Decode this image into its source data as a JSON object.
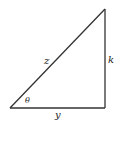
{
  "diagram": {
    "type": "right-triangle",
    "stroke_color": "#333333",
    "vertices": {
      "bottom_left": [
        10,
        108
      ],
      "bottom_right": [
        105,
        108
      ],
      "top_right": [
        105,
        9
      ]
    },
    "labels": {
      "hypotenuse": "z",
      "vertical_side": "k",
      "horizontal_side": "y",
      "angle": "θ"
    }
  }
}
